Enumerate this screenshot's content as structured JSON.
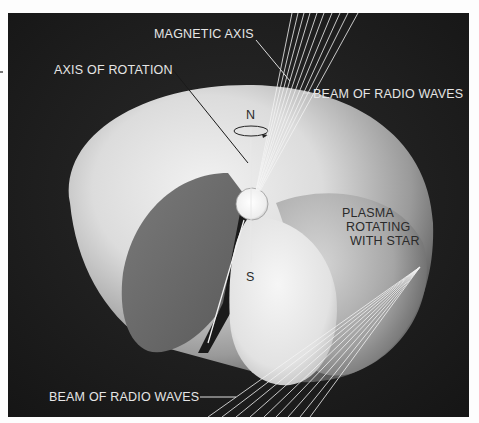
{
  "figure": {
    "labels": {
      "magnetic_axis": "MAGNETIC AXIS",
      "axis_of_rotation": "AXIS OF ROTATION",
      "beam_top": "BEAM OF RADIO WAVES",
      "beam_bottom": "BEAM OF RADIO WAVES",
      "plasma_line1": "PLASMA",
      "plasma_line2": "ROTATING",
      "plasma_line3": "WITH STAR",
      "north_pole": "N",
      "south_pole": "S"
    },
    "colors": {
      "background": "#1e1e1e",
      "plasma_light": "#e8e8e8",
      "plasma_shadow": "#6e6e6e",
      "star": "#f4f4f4",
      "beam_lines": "#f0f0f0",
      "label_on_dark": "#e6e6e6",
      "label_on_light": "#2a2a2a"
    }
  }
}
